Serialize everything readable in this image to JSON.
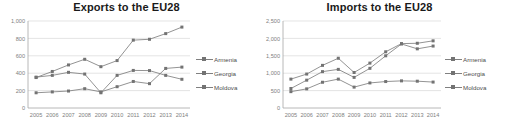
{
  "figure": {
    "panels": [
      "exports",
      "imports"
    ],
    "series_names": [
      "Armenia",
      "Georgia",
      "Moldova"
    ],
    "line_color": "#808080",
    "marker_color": "#737373",
    "grid_color": "#d9d9d9",
    "axis_color": "#a6a6a6",
    "tick_text_color": "#808080",
    "title_color": "#1a1a1a"
  },
  "legend": {
    "armenia": "Armenia",
    "georgia": "Georgia",
    "moldova": "Moldova"
  },
  "chart_data": [
    {
      "type": "line",
      "title": "Exports to the EU28",
      "xlabel": "",
      "ylabel": "",
      "categories": [
        "2005",
        "2006",
        "2007",
        "2008",
        "2009",
        "2010",
        "2011",
        "2012",
        "2013",
        "2014"
      ],
      "yticks": [
        "0",
        "200",
        "400",
        "600",
        "800",
        "1,000"
      ],
      "ytick_values": [
        0,
        200,
        400,
        600,
        800,
        1000
      ],
      "ylim": [
        0,
        1000
      ],
      "grid": true,
      "legend_position": "right",
      "series": [
        {
          "name": "Armenia",
          "values": [
            355,
            375,
            410,
            390,
            175,
            375,
            432,
            430,
            375,
            330
          ]
        },
        {
          "name": "Georgia",
          "values": [
            350,
            420,
            495,
            560,
            475,
            545,
            780,
            790,
            855,
            930
          ]
        },
        {
          "name": "Moldova",
          "values": [
            175,
            185,
            195,
            222,
            185,
            245,
            305,
            280,
            455,
            470
          ]
        }
      ]
    },
    {
      "type": "line",
      "title": "Imports to the EU28",
      "xlabel": "",
      "ylabel": "",
      "categories": [
        "2005",
        "2006",
        "2007",
        "2008",
        "2009",
        "2010",
        "2011",
        "2012",
        "2013",
        "2014"
      ],
      "yticks": [
        "0",
        "500",
        "1,000",
        "1,500",
        "2,000",
        "2,500"
      ],
      "ytick_values": [
        0,
        500,
        1000,
        1500,
        2000,
        2500
      ],
      "ylim": [
        0,
        2500
      ],
      "grid": true,
      "legend_position": "right",
      "series": [
        {
          "name": "Armenia",
          "values": [
            470,
            550,
            740,
            830,
            600,
            720,
            760,
            780,
            770,
            745
          ]
        },
        {
          "name": "Georgia",
          "values": [
            830,
            975,
            1225,
            1430,
            1020,
            1290,
            1615,
            1850,
            1860,
            1930
          ]
        },
        {
          "name": "Moldova",
          "values": [
            560,
            800,
            1045,
            1110,
            880,
            1140,
            1500,
            1840,
            1700,
            1780
          ]
        }
      ]
    }
  ]
}
